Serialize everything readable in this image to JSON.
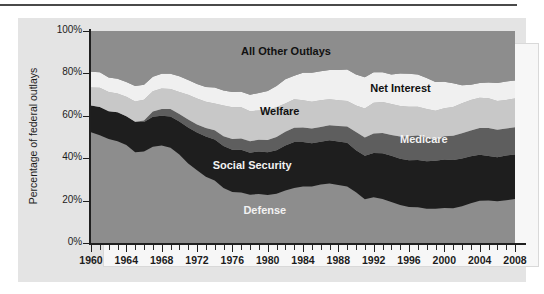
{
  "chart_data": {
    "type": "area",
    "title": "",
    "xlabel": "",
    "ylabel": "Percentage of federal outlays",
    "xlim": [
      1960,
      2008
    ],
    "ylim": [
      0,
      100
    ],
    "grid": false,
    "legend_position": "inline-labels",
    "stacked": true,
    "normalized_percent": true,
    "x_tick_labels": [
      "1960",
      "1964",
      "1968",
      "1972",
      "1976",
      "1980",
      "1984",
      "1988",
      "1992",
      "1996",
      "2000",
      "2004",
      "2008"
    ],
    "x_tick_values": [
      1960,
      1964,
      1968,
      1972,
      1976,
      1980,
      1984,
      1988,
      1992,
      1996,
      2000,
      2004,
      2008
    ],
    "x_minor_tick_interval": 1,
    "y_tick_labels": [
      "0%",
      "20%",
      "40%",
      "60%",
      "80%",
      "100%"
    ],
    "y_tick_values": [
      0,
      20,
      40,
      60,
      80,
      100
    ],
    "x": [
      1960,
      1961,
      1962,
      1963,
      1964,
      1965,
      1966,
      1967,
      1968,
      1969,
      1970,
      1971,
      1972,
      1973,
      1974,
      1975,
      1976,
      1977,
      1978,
      1979,
      1980,
      1981,
      1982,
      1983,
      1984,
      1985,
      1986,
      1987,
      1988,
      1989,
      1990,
      1991,
      1992,
      1993,
      1994,
      1995,
      1996,
      1997,
      1998,
      1999,
      2000,
      2001,
      2002,
      2003,
      2004,
      2005,
      2006,
      2007,
      2008
    ],
    "series": [
      {
        "name": "Defense",
        "color": "#8d8d8d",
        "label_color": "#f2f2f2",
        "values": [
          52.2,
          50.8,
          49.0,
          48.0,
          46.2,
          42.8,
          43.2,
          45.4,
          46.0,
          44.9,
          41.8,
          37.5,
          34.3,
          31.2,
          29.5,
          26.0,
          24.1,
          23.8,
          22.8,
          23.1,
          22.7,
          23.2,
          24.8,
          26.0,
          26.7,
          26.7,
          27.6,
          28.1,
          27.3,
          26.6,
          23.9,
          20.6,
          21.6,
          20.7,
          19.3,
          17.9,
          17.0,
          16.9,
          16.2,
          16.1,
          16.5,
          16.4,
          17.3,
          18.8,
          19.9,
          20.0,
          19.7,
          20.2,
          20.7
        ]
      },
      {
        "name": "Social Security",
        "color": "#1e1e1e",
        "label_color": "#f2f2f2",
        "values": [
          12.6,
          13.4,
          13.2,
          13.7,
          13.6,
          14.4,
          13.9,
          14.1,
          14.0,
          14.8,
          15.5,
          17.0,
          17.8,
          19.0,
          19.3,
          19.7,
          19.9,
          20.2,
          19.8,
          20.1,
          20.1,
          20.6,
          21.2,
          21.6,
          20.9,
          20.3,
          20.2,
          20.4,
          20.6,
          20.7,
          19.8,
          20.6,
          20.9,
          21.6,
          21.8,
          21.8,
          22.0,
          22.2,
          22.4,
          22.7,
          22.9,
          22.8,
          22.6,
          22.1,
          21.7,
          21.0,
          20.7,
          21.1,
          21.1
        ]
      },
      {
        "name": "Medicare",
        "color": "#5e5e5e",
        "label_color": "#f2f2f2",
        "values": [
          0.0,
          0.0,
          0.0,
          0.0,
          0.0,
          0.0,
          0.7,
          2.5,
          3.2,
          3.5,
          3.6,
          3.8,
          3.8,
          4.0,
          4.4,
          4.6,
          5.0,
          5.3,
          5.4,
          5.5,
          5.8,
          6.2,
          6.5,
          6.8,
          6.9,
          7.0,
          6.9,
          7.0,
          7.3,
          7.6,
          8.6,
          8.6,
          9.2,
          9.6,
          9.9,
          10.5,
          11.3,
          11.6,
          11.0,
          10.2,
          11.0,
          11.4,
          11.9,
          12.2,
          12.6,
          13.3,
          13.0,
          12.7,
          12.8
        ]
      },
      {
        "name": "Welfare",
        "color": "#c8c8c8",
        "label_color": "#111111",
        "values": [
          8.5,
          9.0,
          9.0,
          8.8,
          9.2,
          9.6,
          9.8,
          9.6,
          9.7,
          9.5,
          10.3,
          11.6,
          12.3,
          12.4,
          12.6,
          14.6,
          15.0,
          14.7,
          14.2,
          13.8,
          14.2,
          14.0,
          13.3,
          13.4,
          12.8,
          12.6,
          12.6,
          12.3,
          12.1,
          12.1,
          12.5,
          13.7,
          14.5,
          14.6,
          14.6,
          14.4,
          14.0,
          13.6,
          13.6,
          13.4,
          13.2,
          13.6,
          14.1,
          14.4,
          14.3,
          14.0,
          13.6,
          13.5,
          13.6
        ]
      },
      {
        "name": "Net Interest",
        "color": "#f0f0f0",
        "label_color": "#111111",
        "values": [
          7.5,
          7.3,
          6.9,
          7.0,
          7.0,
          7.3,
          7.0,
          6.8,
          6.9,
          7.1,
          7.4,
          7.0,
          6.8,
          7.0,
          7.5,
          7.0,
          7.2,
          7.3,
          7.7,
          8.3,
          8.9,
          10.1,
          11.4,
          11.1,
          13.0,
          13.7,
          13.7,
          13.8,
          14.3,
          14.8,
          14.7,
          14.7,
          14.4,
          14.1,
          13.9,
          15.3,
          15.5,
          15.2,
          14.6,
          13.5,
          12.5,
          11.1,
          8.5,
          7.1,
          7.0,
          7.4,
          8.5,
          8.7,
          8.5
        ]
      },
      {
        "name": "All Other Outlays",
        "color": "#8d8d8d",
        "label_color": "#111111",
        "values": [
          19.2,
          19.5,
          21.9,
          22.5,
          24.0,
          25.9,
          25.4,
          21.6,
          20.2,
          20.2,
          21.4,
          23.1,
          25.0,
          26.4,
          26.7,
          28.1,
          28.8,
          28.7,
          30.1,
          29.2,
          28.3,
          25.9,
          22.8,
          21.1,
          19.7,
          19.7,
          19.0,
          18.4,
          18.4,
          18.2,
          20.5,
          21.8,
          19.4,
          19.4,
          20.5,
          20.1,
          20.2,
          20.5,
          22.2,
          24.1,
          23.9,
          24.7,
          25.6,
          25.4,
          24.5,
          24.3,
          24.5,
          23.8,
          23.3
        ]
      }
    ],
    "band_labels": [
      {
        "text": "All Other Outlays",
        "x_pct": 46.0,
        "y_pct": 90.0,
        "tone": "dark"
      },
      {
        "text": "Net Interest",
        "x_pct": 73.0,
        "y_pct": 72.5,
        "tone": "dark"
      },
      {
        "text": "Welfare",
        "x_pct": 44.5,
        "y_pct": 62.0,
        "tone": "dark"
      },
      {
        "text": "Medicare",
        "x_pct": 78.5,
        "y_pct": 48.5,
        "tone": "light"
      },
      {
        "text": "Social Security",
        "x_pct": 38.0,
        "y_pct": 36.5,
        "tone": "light"
      },
      {
        "text": "Defense",
        "x_pct": 41.0,
        "y_pct": 15.0,
        "tone": "light"
      }
    ]
  },
  "colors": {
    "panel_background": "#e4e4e4",
    "plot_background": "#8d8d8d",
    "axis": "#1f1f1f",
    "text": "#1c1c1c",
    "top_rule": "#4a4a4a"
  }
}
